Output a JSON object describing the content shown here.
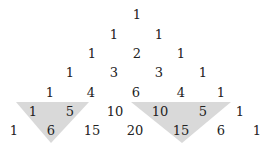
{
  "highlight_color": "#d9d9d9",
  "rows": [
    {
      "y": 14,
      "cells": [
        {
          "v": "1",
          "x": 137
        }
      ]
    },
    {
      "y": 34,
      "cells": [
        {
          "v": "1",
          "x": 114
        },
        {
          "v": "1",
          "x": 159
        }
      ]
    },
    {
      "y": 53,
      "cells": [
        {
          "v": "1",
          "x": 92
        },
        {
          "v": "2",
          "x": 137
        },
        {
          "v": "1",
          "x": 181
        }
      ]
    },
    {
      "y": 72,
      "cells": [
        {
          "v": "1",
          "x": 70
        },
        {
          "v": "3",
          "x": 114
        },
        {
          "v": "3",
          "x": 159
        },
        {
          "v": "1",
          "x": 203
        }
      ]
    },
    {
      "y": 92,
      "cells": [
        {
          "v": "1",
          "x": 50
        },
        {
          "v": "4",
          "x": 91
        },
        {
          "v": "6",
          "x": 136
        },
        {
          "v": "4",
          "x": 181
        },
        {
          "v": "1",
          "x": 221
        }
      ]
    },
    {
      "y": 111,
      "cells": [
        {
          "v": "1",
          "x": 33
        },
        {
          "v": "5",
          "x": 70
        },
        {
          "v": "10",
          "x": 115
        },
        {
          "v": "10",
          "x": 160
        },
        {
          "v": "5",
          "x": 203
        },
        {
          "v": "1",
          "x": 240
        }
      ]
    },
    {
      "y": 130,
      "cells": [
        {
          "v": "1",
          "x": 14
        },
        {
          "v": "6",
          "x": 51
        },
        {
          "v": "15",
          "x": 92
        },
        {
          "v": "20",
          "x": 135
        },
        {
          "v": "15",
          "x": 181
        },
        {
          "v": "6",
          "x": 221
        },
        {
          "v": "1",
          "x": 257
        }
      ]
    }
  ],
  "highlights": [
    {
      "points": "16,102 89,102 51,143"
    },
    {
      "points": "131,102 231,102 182,143"
    }
  ]
}
